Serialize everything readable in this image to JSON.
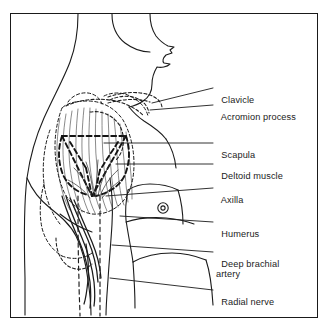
{
  "figure": {
    "border_color": "#1a1a1a",
    "background_color": "#ffffff",
    "ink_color": "#1b1b1b"
  },
  "labels": [
    {
      "id": "clavicle",
      "text": "Clavicle",
      "text2": "",
      "x": 216,
      "y": 84,
      "leader_x1": 213,
      "leader_y1": 88,
      "leader_x2": 152,
      "leader_y2": 103
    },
    {
      "id": "acromion",
      "text": "Acromion process",
      "text2": "",
      "x": 216,
      "y": 101,
      "leader_x1": 213,
      "leader_y1": 105,
      "leader_x2": 150,
      "leader_y2": 110
    },
    {
      "id": "scapula",
      "text": "Scapula",
      "text2": "",
      "x": 216,
      "y": 139,
      "leader_x1": 213,
      "leader_y1": 143,
      "leader_x2": 104,
      "leader_y2": 143
    },
    {
      "id": "deltoid",
      "text": "Deltoid muscle",
      "text2": "",
      "x": 216,
      "y": 160,
      "leader_x1": 213,
      "leader_y1": 164,
      "leader_x2": 116,
      "leader_y2": 164
    },
    {
      "id": "axilla",
      "text": "Axilla",
      "text2": "",
      "x": 216,
      "y": 184,
      "leader_x1": 213,
      "leader_y1": 188,
      "leader_x2": 106,
      "leader_y2": 196
    },
    {
      "id": "humerus",
      "text": "Humerus",
      "text2": "",
      "x": 216,
      "y": 218,
      "leader_x1": 213,
      "leader_y1": 222,
      "leader_x2": 120,
      "leader_y2": 216
    },
    {
      "id": "deep-brachial",
      "text": "Deep brachial",
      "text2": "artery",
      "x": 216,
      "y": 248,
      "leader_x1": 213,
      "leader_y1": 252,
      "leader_x2": 112,
      "leader_y2": 245
    },
    {
      "id": "radial-nerve",
      "text": "Radial nerve",
      "text2": "",
      "x": 216,
      "y": 286,
      "leader_x1": 213,
      "leader_y1": 290,
      "leader_x2": 110,
      "leader_y2": 278
    }
  ],
  "structures": {
    "body_outline": "head in profile with nose, lips, chin, jaw, neck, back and arm contour",
    "nipple": "small concentric circle marker on chest",
    "scapula_outline": "bold dashed triangular bone outline over shoulder blade",
    "deltoid_outline": "fine dashed muscle outline with vertical fiber hatching",
    "humerus_shaft": "two vertical dashed lines descending through the arm",
    "neurovascular_bundle": "paired solid curved lines for deep brachial artery and radial nerve"
  }
}
